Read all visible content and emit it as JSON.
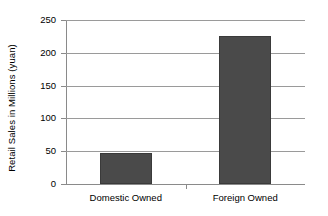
{
  "chart_data": {
    "type": "bar",
    "title": "",
    "xlabel": "",
    "ylabel": "Retail Sales in Millions (yuan)",
    "categories": [
      "Domestic Owned",
      "Foreign Owned"
    ],
    "values": [
      47,
      225
    ],
    "ylim": [
      0,
      250
    ],
    "yticks": [
      0,
      50,
      100,
      150,
      200,
      250
    ],
    "ytick_labels": [
      "0",
      "50",
      "100",
      "150",
      "200",
      "250"
    ],
    "grid": true,
    "legend": false,
    "legend_position": "none",
    "series": [
      {
        "name": "Retail Sales",
        "values": [
          47,
          225
        ],
        "color": "#4a4a4a"
      }
    ],
    "colors": {
      "bar_fill": "#4a4a4a",
      "bar_border": "#3a3a3a",
      "gridline": "#9a9a9a",
      "axis": "#8a8a8a",
      "text": "#000000",
      "background": "#ffffff"
    }
  }
}
